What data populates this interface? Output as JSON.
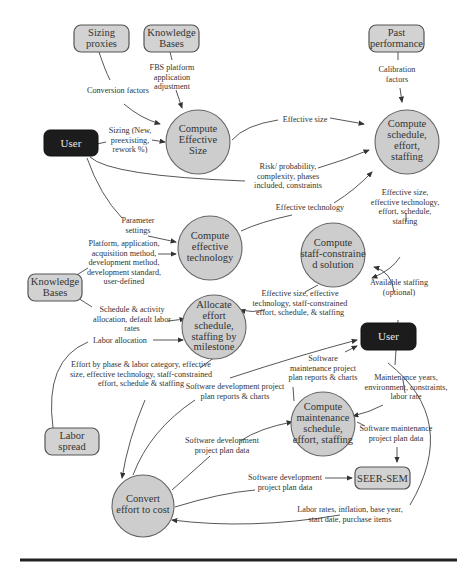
{
  "nodes": {
    "sizing_proxies": [
      "Sizing",
      "proxies"
    ],
    "knowledge_bases_top": [
      "Knowledge",
      "Bases"
    ],
    "past_performance": [
      "Past",
      "performance"
    ],
    "user_top": [
      "User"
    ],
    "compute_effective_size": [
      "Compute",
      "Effective",
      "Size"
    ],
    "compute_schedule": [
      "Compute",
      "schedule,",
      "effort,",
      "staffing"
    ],
    "compute_effective_technology": [
      "Compute",
      "effective",
      "technology"
    ],
    "compute_staff_constrained": [
      "Compute",
      "staff-constraine",
      "d solution"
    ],
    "knowledge_bases_left": [
      "Knowledge",
      "Bases"
    ],
    "allocate_effort": [
      "Allocate",
      "effort",
      "schedule,",
      "staffing by",
      "milestone"
    ],
    "user_right": [
      "User"
    ],
    "compute_maintenance": [
      "Compute",
      "maintenance",
      "schedule,",
      "effort, staffing"
    ],
    "labor_spread": [
      "Labor",
      "spread"
    ],
    "seer_sem": [
      "SEER-SEM"
    ],
    "convert_effort": [
      "Convert",
      "effort to cost"
    ]
  },
  "edge_labels": {
    "conversion_factors": [
      "Conversion factors"
    ],
    "fbs_platform": [
      "FBS platform",
      "application",
      "adjustment"
    ],
    "calibration_factors": [
      "Calibration",
      "factors"
    ],
    "sizing_input": [
      "Sizing (New,",
      "preexisting,",
      "rework %)"
    ],
    "effective_size": [
      "Effective size"
    ],
    "risk": [
      "Risk/ probability,",
      "complexity, phases",
      "included, constraints"
    ],
    "effective_technology": [
      "Effective technology"
    ],
    "parameter_settings": [
      "Parameter",
      "settings"
    ],
    "platform": [
      "Platform, application,",
      "acquisition method,",
      "development method,",
      "development standard,",
      "user-defined"
    ],
    "schedule_outputs": [
      "Effective size,",
      "effective technology,",
      "effort, schedule,",
      "staffing"
    ],
    "staff_constrained_outputs": [
      "Effective size, effective",
      "technology, staff-constrained",
      "effort, schedule, & staffing"
    ],
    "available_staffing": [
      "Available staffing",
      "(optional)"
    ],
    "schedule_activity": [
      "Schedule & activity",
      "allocation, default labor",
      "rates"
    ],
    "labor_allocation": [
      "Labor allocation"
    ],
    "effort_by_phase": [
      "Effort by phase & labor category, effective",
      "size, effective technology, staff-constrained",
      "effort, schedule & staffing"
    ],
    "sw_maint_reports": [
      "Software",
      "maintenance project",
      "plan reports & charts"
    ],
    "sw_dev_reports": [
      "Software development project",
      "plan reports & charts"
    ],
    "maintenance_years": [
      "Maintenance years,",
      "environment, constraints,",
      "labor rate"
    ],
    "sw_dev_data_1": [
      "Software development",
      "project plan data"
    ],
    "sw_maint_data": [
      "Software maintenance",
      "project plan data"
    ],
    "sw_dev_data_2": [
      "Software development",
      "project plan data"
    ],
    "labor_rates": [
      "Labor rates, inflation, base year,",
      "start date, purchase items"
    ]
  },
  "colors": {
    "process_fill": "#cdcdcd",
    "box_fill": "#d2d2d2",
    "user_fill": "#1c1c1c",
    "line": "#444444"
  }
}
